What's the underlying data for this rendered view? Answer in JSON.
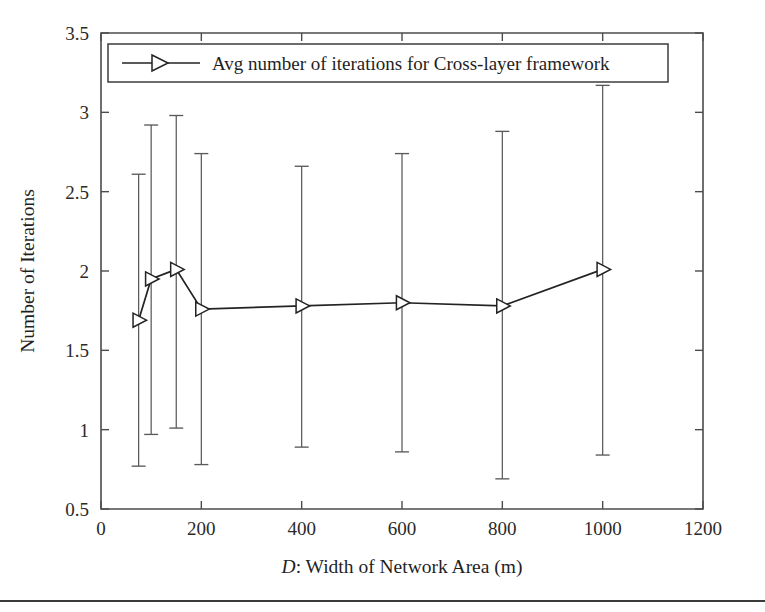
{
  "figure": {
    "background_color": "#ffffff",
    "line_color": "#232323",
    "errorbar_color": "#5a5a5a",
    "axis_color": "#4c4c4c",
    "bottom_rule_visible": "true"
  },
  "axes": {
    "x_title_prefix": "D",
    "x_title_rest": ": Width of Network Area (m)",
    "y_title": "Number of Iterations"
  },
  "legend": {
    "position": "top",
    "entries": [
      {
        "label": "Avg number of iterations for Cross-layer framework",
        "marker": "right-triangle-open",
        "line": "solid"
      }
    ]
  },
  "chart_data": {
    "type": "line",
    "title": "",
    "xlabel": "D: Width of Network Area (m)",
    "ylabel": "Number of Iterations",
    "xlim": [
      0,
      1200
    ],
    "ylim": [
      0.5,
      3.5
    ],
    "xticks": [
      0,
      200,
      400,
      600,
      800,
      1000,
      1200
    ],
    "yticks": [
      0.5,
      1,
      1.5,
      2,
      2.5,
      3,
      3.5
    ],
    "xtick_labels": [
      "0",
      "200",
      "400",
      "600",
      "800",
      "1000",
      "1200"
    ],
    "ytick_labels": [
      "0.5",
      "1",
      "1.5",
      "2",
      "2.5",
      "3",
      "3.5"
    ],
    "grid": false,
    "legend_position": "upper center",
    "series": [
      {
        "name": "Avg number of iterations for Cross-layer framework",
        "marker": "right-triangle-open",
        "x": [
          75,
          100,
          150,
          200,
          400,
          600,
          800,
          1000
        ],
        "values": [
          1.69,
          1.95,
          2.01,
          1.76,
          1.78,
          1.8,
          1.78,
          2.01
        ],
        "error_low": [
          0.77,
          0.97,
          1.01,
          0.78,
          0.89,
          0.86,
          0.69,
          0.84
        ],
        "error_high": [
          2.61,
          2.92,
          2.98,
          2.74,
          2.66,
          2.74,
          2.88,
          3.17
        ]
      }
    ]
  }
}
